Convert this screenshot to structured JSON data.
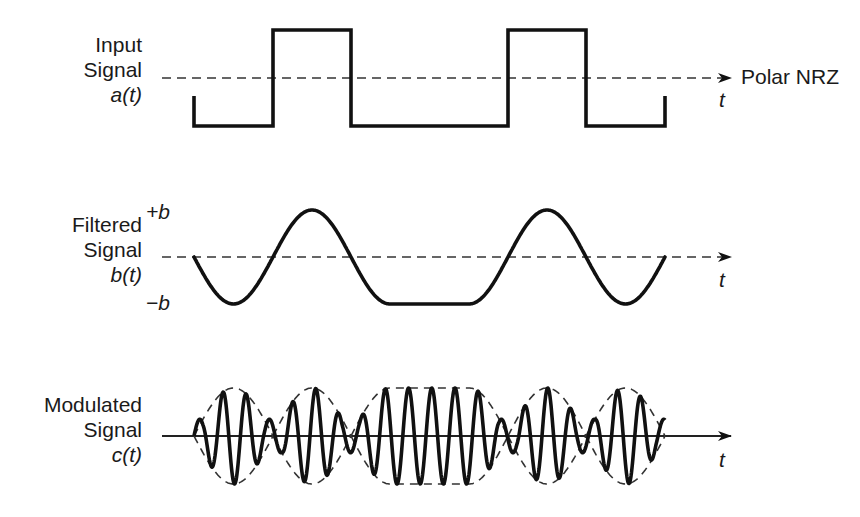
{
  "diagram": {
    "panels": [
      {
        "id": "input",
        "label_lines": [
          "Input",
          "Signal"
        ],
        "label_math": "a(t)",
        "axis_label": "t",
        "right_annotation": "Polar NRZ",
        "baseline_y": 78,
        "high_y": 30,
        "low_y": 126,
        "start_x": 194,
        "end_x": 665,
        "stub_y": 96,
        "transitions": [
          273,
          351,
          508,
          586
        ],
        "bits": [
          -1,
          1,
          -1,
          -1,
          1,
          -1
        ],
        "arrow_end_x": 731
      },
      {
        "id": "filtered",
        "label_lines": [
          "Filtered",
          "Signal"
        ],
        "label_math": "b(t)",
        "axis_label": "t",
        "plus_label": "+b",
        "minus_label": "−b",
        "baseline_y": 257,
        "amplitude": 47,
        "start_x": 194,
        "end_x": 665,
        "arrow_end_x": 731
      },
      {
        "id": "modulated",
        "label_lines": [
          "Modulated",
          "Signal"
        ],
        "label_math": "c(t)",
        "axis_label": "t",
        "baseline_y": 436,
        "amplitude": 48,
        "start_x": 194,
        "end_x": 665,
        "carrier_period": 23.2,
        "arrow_end_x": 731
      }
    ],
    "colors": {
      "stroke": "#111111",
      "dash": "#333333",
      "text": "#1a1a1a"
    }
  }
}
